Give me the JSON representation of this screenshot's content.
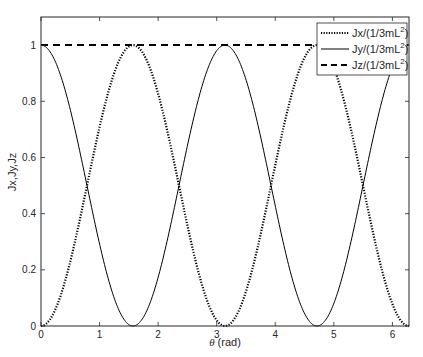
{
  "chart_data": {
    "type": "line",
    "title": "",
    "xlabel": "θ (rad)",
    "ylabel": "Jx,Jy,Jz",
    "xlim": [
      0,
      6.2832
    ],
    "ylim": [
      0,
      1.1
    ],
    "xticks": [
      0,
      1,
      2,
      3,
      4,
      5,
      6
    ],
    "xtick_labels": [
      "0",
      "1",
      "2",
      "3",
      "4",
      "5",
      "6"
    ],
    "yticks": [
      0,
      0.2,
      0.4,
      0.6,
      0.8,
      1
    ],
    "ytick_labels": [
      "0",
      "0.2",
      "0.4",
      "0.6",
      "0.8",
      "1"
    ],
    "grid": false,
    "legend_position": "northeast",
    "x": [
      0,
      0.3927,
      0.7854,
      1.1781,
      1.5708,
      1.9635,
      2.3562,
      2.7489,
      3.1416,
      3.5343,
      3.927,
      4.3197,
      4.7124,
      5.1051,
      5.4978,
      5.8905,
      6.2832
    ],
    "series": [
      {
        "name": "Jx/(1/3mL²)",
        "label_base": "Jx/(1/3mL",
        "formula": "sin^2(theta)",
        "line_style": "dotted",
        "color": "#000000",
        "values": [
          0,
          0.1464,
          0.5,
          0.8536,
          1,
          0.8536,
          0.5,
          0.1464,
          0,
          0.1464,
          0.5,
          0.8536,
          1,
          0.8536,
          0.5,
          0.1464,
          0
        ]
      },
      {
        "name": "Jy/(1/3mL²)",
        "label_base": "Jy/(1/3mL",
        "formula": "cos^2(theta)",
        "line_style": "solid",
        "color": "#000000",
        "values": [
          1,
          0.8536,
          0.5,
          0.1464,
          0,
          0.1464,
          0.5,
          0.8536,
          1,
          0.8536,
          0.5,
          0.1464,
          0,
          0.1464,
          0.5,
          0.8536,
          1
        ]
      },
      {
        "name": "Jz/(1/3mL²)",
        "label_base": "Jz/(1/3mL",
        "formula": "1",
        "line_style": "dashed",
        "color": "#000000",
        "values": [
          1,
          1,
          1,
          1,
          1,
          1,
          1,
          1,
          1,
          1,
          1,
          1,
          1,
          1,
          1,
          1,
          1
        ]
      }
    ],
    "annotations": [
      "curves intersect at y=0.5 at θ = π/4 + kπ/2"
    ]
  },
  "legend": {
    "superscript": "2",
    "close_paren": ")"
  },
  "colors": {
    "axis": "#262626",
    "line": "#000000",
    "legend_border": "#262626",
    "background": "#ffffff"
  }
}
